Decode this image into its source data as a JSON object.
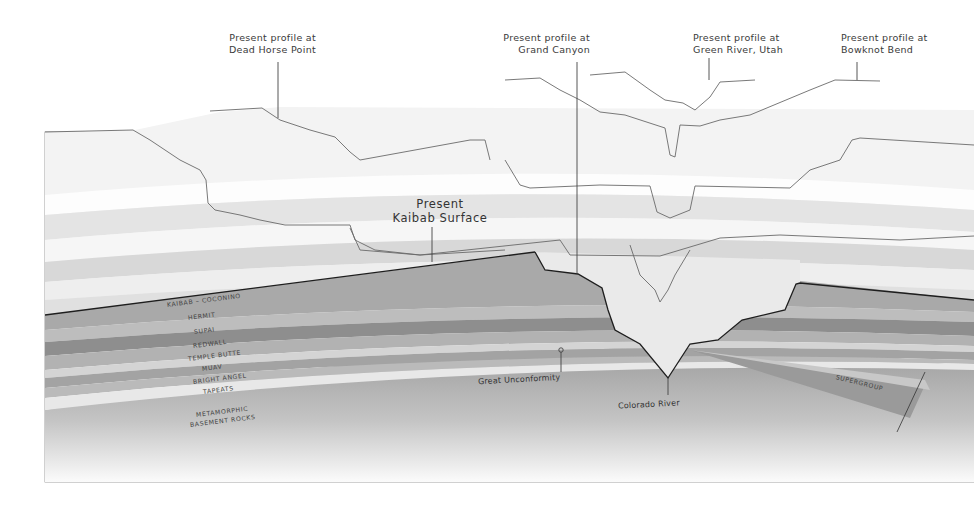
{
  "diagram": {
    "title_labels": {
      "dead_horse_point": [
        "Present profile at",
        "Dead Horse Point"
      ],
      "grand_canyon": [
        "Present profile at",
        "Grand Canyon"
      ],
      "green_river": [
        "Present profile at",
        "Green River, Utah"
      ],
      "bowknot_bend": [
        "Present profile at",
        "Bowknot Bend"
      ],
      "kaibab_surface": [
        "Present",
        "Kaibab Surface"
      ]
    },
    "strata": [
      {
        "name": "KAIBAB – COCONINO",
        "color": "#a9a9a9"
      },
      {
        "name": "HERMIT",
        "color": "#bdbdbd"
      },
      {
        "name": "SUPAI",
        "color": "#8e8e8e"
      },
      {
        "name": "REDWALL",
        "color": "#b2b2b2"
      },
      {
        "name": "TEMPLE BUTTE",
        "color": "#d2d2d2"
      },
      {
        "name": "MUAV",
        "color": "#a3a3a3"
      },
      {
        "name": "BRIGHT ANGEL",
        "color": "#bababa"
      },
      {
        "name": "TAPEATS",
        "color": "#e6e6e6"
      },
      {
        "name": "METAMORPHIC",
        "color": "#b5b5b5"
      },
      {
        "name": "BASEMENT ROCKS",
        "color": "#b5b5b5"
      }
    ],
    "annotations": {
      "great_unconformity": "Great Unconformity",
      "colorado_river": "Colorado River",
      "supergroup": "SUPERGROUP"
    },
    "colors": {
      "outline": "#222222",
      "profile_line": "#6a6a6a",
      "upper_light": "#ededed",
      "upper_mid": "#dcdcdc",
      "basement_top": "#9e9e9e",
      "basement_bottom": "#fafafa"
    }
  }
}
